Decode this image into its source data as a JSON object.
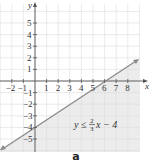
{
  "chart_data": {
    "type": "line",
    "title": "",
    "inequality": "y ≤ (2/3)x − 4",
    "equation_parts": {
      "lhs": "y",
      "op": "≤",
      "num": "2",
      "den": "3",
      "rhs_tail": "x − 4"
    },
    "boundary_line": {
      "slope": 0.6667,
      "intercept": -4,
      "style": "solid",
      "points": [
        [
          -3,
          -6
        ],
        [
          9,
          2
        ]
      ]
    },
    "shaded_region": "below line",
    "xlabel": "x",
    "ylabel": "y",
    "xlim": [
      -3,
      9
    ],
    "ylim": [
      -6,
      6
    ],
    "x_ticks": [
      "-2",
      "-1",
      "1",
      "2",
      "3",
      "4",
      "5",
      "6",
      "7",
      "8"
    ],
    "y_ticks": [
      "5",
      "4",
      "3",
      "2",
      "1",
      "-1",
      "-2",
      "-3",
      "-4",
      "-5"
    ],
    "grid": true,
    "colors": {
      "line": "#8a8a8a",
      "shade": "#ececec",
      "grid": "#dcdcdc",
      "axis": "#555555"
    }
  },
  "figure_label": "a"
}
